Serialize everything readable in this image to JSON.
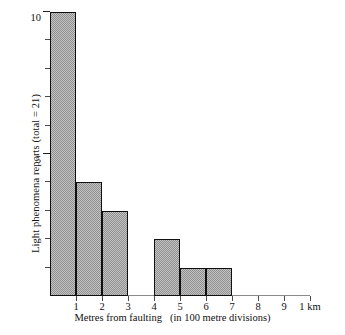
{
  "chart_data": {
    "type": "bar",
    "title": "",
    "xlabel_main": "Metres from faulting",
    "xlabel_note": "(in 100 metre divisions)",
    "ylabel": "Light phenomena reports (total = 21)",
    "categories": [
      "0-1",
      "1-2",
      "2-3",
      "3-4",
      "4-5",
      "5-6",
      "6-7",
      "7-8",
      "8-9"
    ],
    "values": [
      10,
      4,
      3,
      0,
      2,
      1,
      1,
      0,
      0
    ],
    "total": 21,
    "ylim": [
      0,
      10
    ],
    "xlim": [
      0,
      10
    ],
    "grid": false,
    "legend": "none",
    "y_ticks": [
      1,
      2,
      3,
      4,
      5,
      6,
      7,
      8,
      9,
      10
    ],
    "y_tick_labels": [
      {
        "value": 5,
        "label": "5"
      },
      {
        "value": 10,
        "label": "10"
      }
    ],
    "x_ticks": [
      1,
      2,
      3,
      4,
      5,
      6,
      7,
      8,
      9,
      10
    ],
    "x_tick_labels": [
      {
        "value": 1,
        "label": "1"
      },
      {
        "value": 2,
        "label": "2"
      },
      {
        "value": 3,
        "label": "3"
      },
      {
        "value": 4,
        "label": "4"
      },
      {
        "value": 5,
        "label": "5"
      },
      {
        "value": 6,
        "label": "6"
      },
      {
        "value": 7,
        "label": "7"
      },
      {
        "value": 8,
        "label": "8"
      },
      {
        "value": 9,
        "label": "9"
      },
      {
        "value": 10,
        "label": "1 km"
      }
    ],
    "bar_fill_color": "#a8a8a8",
    "bar_edge_color": "#111111",
    "axis_color": "#8a8a8a"
  }
}
